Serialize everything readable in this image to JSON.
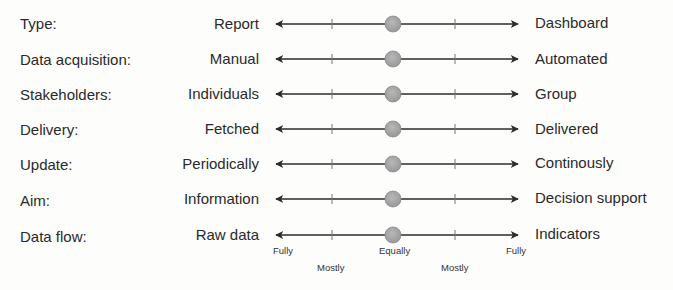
{
  "diagram": {
    "type": "semantic-differential-scale",
    "dimensions": [
      {
        "label": "Type:",
        "left": "Report",
        "right": "Dashboard",
        "position": "Equally"
      },
      {
        "label": "Data acquisition:",
        "left": "Manual",
        "right": "Automated",
        "position": "Equally"
      },
      {
        "label": "Stakeholders:",
        "left": "Individuals",
        "right": "Group",
        "position": "Equally"
      },
      {
        "label": "Delivery:",
        "left": "Fetched",
        "right": "Delivered",
        "position": "Equally"
      },
      {
        "label": "Update:",
        "left": "Periodically",
        "right": "Continously",
        "position": "Equally"
      },
      {
        "label": "Aim:",
        "left": "Information",
        "right": "Decision support",
        "position": "Equally"
      },
      {
        "label": "Data flow:",
        "left": "Raw data",
        "right": "Indicators",
        "position": "Equally"
      }
    ],
    "scale_labels": [
      "Fully",
      "Mostly",
      "Equally",
      "Mostly",
      "Fully"
    ],
    "colors": {
      "line": "#2b2b2b",
      "marker_fill": "#a3a3a3",
      "marker_stroke": "#8a8a8a"
    }
  }
}
